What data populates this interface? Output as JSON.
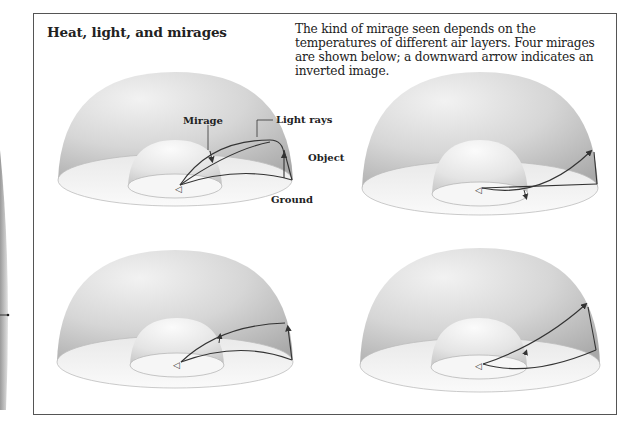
{
  "diagram": {
    "title": "Heat, light, and mirages",
    "description": "The kind of mirage seen depends on the temperatures of different air layers. Four mirages are shown below; a downward arrow indicates an inverted image.",
    "labels": {
      "mirage": "Mirage",
      "light_rays": "Light rays",
      "object": "Object",
      "ground": "Ground"
    },
    "panels": [
      {
        "position": "top-left",
        "mirage_arrow": "up",
        "labeled": true
      },
      {
        "position": "top-right",
        "mirage_arrow": "up",
        "labeled": false
      },
      {
        "position": "bottom-left",
        "mirage_arrow": "up",
        "labeled": false
      },
      {
        "position": "bottom-right",
        "mirage_arrow": "up",
        "labeled": false
      }
    ],
    "colors": {
      "frame": "#555555",
      "dome_outer": "#c9c9c9",
      "dome_inner": "#e6e6e6",
      "ray": "#333333"
    }
  }
}
